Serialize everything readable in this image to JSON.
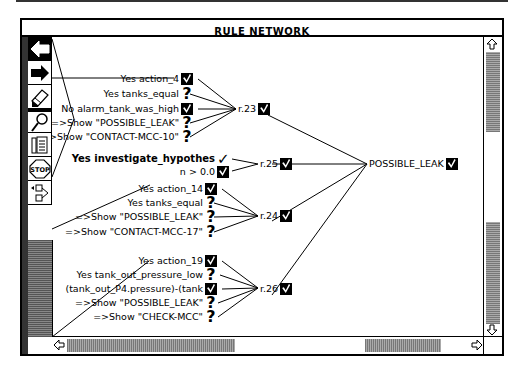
{
  "window": {
    "title": "RULE NETWORK"
  },
  "toolbar": {
    "items": [
      {
        "name": "back-arrow",
        "label": "Back"
      },
      {
        "name": "forward-arrow",
        "label": "Forward"
      },
      {
        "name": "eraser",
        "label": "Erase"
      },
      {
        "name": "magnifier",
        "label": "Zoom"
      },
      {
        "name": "notes",
        "label": "Notes"
      },
      {
        "name": "stop",
        "label": "STOP"
      },
      {
        "name": "tree",
        "label": "Tree"
      }
    ]
  },
  "network": {
    "goal": {
      "label": "POSSIBLE_LEAK",
      "status": "checked"
    },
    "rules": [
      {
        "id": "r.23",
        "status": "checked",
        "conditions": [
          {
            "text": "Yes action_4",
            "status": "checked"
          },
          {
            "text": "Yes tanks_equal",
            "status": "unknown"
          },
          {
            "text": "No alarm_tank_was_high",
            "status": "checked"
          },
          {
            "text": "=>Show \"POSSIBLE_LEAK\"",
            "status": "unknown"
          },
          {
            "text": "=>Show \"CONTACT-MCC-10\"",
            "status": "unknown"
          }
        ]
      },
      {
        "id": "r.25",
        "status": "checked",
        "conditions": [
          {
            "text": "Yes investigate_hypothes",
            "status": "true",
            "bold": true
          },
          {
            "text": "n > 0.0",
            "status": "checked"
          }
        ]
      },
      {
        "id": "r.24",
        "status": "checked",
        "conditions": [
          {
            "text": "Yes action_14",
            "status": "checked"
          },
          {
            "text": "Yes tanks_equal",
            "status": "unknown"
          },
          {
            "text": "=>Show \"POSSIBLE_LEAK\"",
            "status": "unknown"
          },
          {
            "text": "=>Show \"CONTACT-MCC-17\"",
            "status": "unknown"
          }
        ]
      },
      {
        "id": "r.26",
        "status": "checked",
        "conditions": [
          {
            "text": "Yes action_19",
            "status": "checked"
          },
          {
            "text": "Yes tank_out_pressure_low",
            "status": "unknown"
          },
          {
            "text": "(tank_out_P4.pressure)-(tank",
            "status": "checked"
          },
          {
            "text": "=>Show \"POSSIBLE_LEAK\"",
            "status": "unknown"
          },
          {
            "text": "=>Show \"CHECK-MCC\"",
            "status": "unknown"
          }
        ]
      }
    ],
    "symbols": {
      "unknown": "?",
      "true": "✓"
    }
  },
  "scrollbars": {
    "vertical": {
      "up": "scroll-up",
      "down": "scroll-down"
    },
    "horizontal": {
      "left": "scroll-left",
      "right": "scroll-right"
    }
  }
}
